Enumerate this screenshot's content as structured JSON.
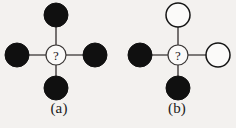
{
  "figure": {
    "background_color": "#f3f1ef",
    "edge_color": "#555150",
    "filled_node_color": "#101010",
    "hollow_node_color": "#fbfaf9",
    "node_outline_color": "#141414",
    "center_query_symbol": "?",
    "panels": [
      {
        "id": "a",
        "caption": "(a)",
        "center": {
          "label": "?",
          "style": "query",
          "cx": 56,
          "cy": 55,
          "r": 10
        },
        "nodes": [
          {
            "position": "top",
            "style": "filled",
            "cx": 56,
            "cy": 15,
            "r": 12
          },
          {
            "position": "left",
            "style": "filled",
            "cx": 17,
            "cy": 55,
            "r": 12
          },
          {
            "position": "right",
            "style": "filled",
            "cx": 95,
            "cy": 55,
            "r": 12
          },
          {
            "position": "bottom",
            "style": "filled",
            "cx": 56,
            "cy": 88,
            "r": 12
          }
        ],
        "edges": [
          {
            "from": "center",
            "to": "top"
          },
          {
            "from": "center",
            "to": "left"
          },
          {
            "from": "center",
            "to": "right"
          },
          {
            "from": "center",
            "to": "bottom"
          }
        ]
      },
      {
        "id": "b",
        "caption": "(b)",
        "center": {
          "label": "?",
          "style": "query",
          "cx": 60,
          "cy": 55,
          "r": 10
        },
        "nodes": [
          {
            "position": "top",
            "style": "hollow",
            "cx": 60,
            "cy": 15,
            "r": 12
          },
          {
            "position": "left",
            "style": "filled",
            "cx": 22,
            "cy": 55,
            "r": 12
          },
          {
            "position": "right",
            "style": "hollow",
            "cx": 100,
            "cy": 55,
            "r": 12
          },
          {
            "position": "bottom",
            "style": "filled",
            "cx": 60,
            "cy": 88,
            "r": 12
          }
        ],
        "edges": [
          {
            "from": "center",
            "to": "top"
          },
          {
            "from": "center",
            "to": "left"
          },
          {
            "from": "center",
            "to": "right"
          },
          {
            "from": "center",
            "to": "bottom"
          }
        ]
      }
    ]
  }
}
